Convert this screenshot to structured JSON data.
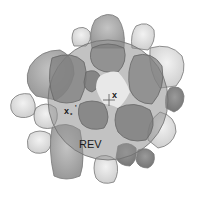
{
  "diagram": {
    "type": "REV illustration",
    "labels": {
      "center_point": "x",
      "neighbor_point": "x",
      "neighbor_subscript": "*",
      "neighbor_prime": "'",
      "region": "REV"
    },
    "colors": {
      "background": "#ffffff",
      "circle_fill": "#8f8f8f",
      "blob_dark": "#7a7a7a",
      "blob_mid": "#a8a8a8",
      "blob_light": "#dcdcdc",
      "outline": "#6e6e6e",
      "pore_center": "#e6e6e6"
    }
  }
}
